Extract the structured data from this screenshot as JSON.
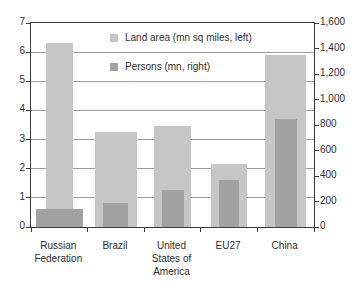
{
  "figure": {
    "background": "#ffffff"
  },
  "chart_data": {
    "type": "bar",
    "title": "",
    "xlabel": "",
    "ylabel_left": "Land area (mn sq miles)",
    "ylabel_right": "Persons (mn)",
    "categories": [
      "Russian Federation",
      "Brazil",
      "United States of America",
      "EU27",
      "China"
    ],
    "category_label_lines": [
      "Russian\nFederation",
      "Brazil",
      "United\nStates of\nAmerica",
      "EU27",
      "China"
    ],
    "series": [
      {
        "name": "Land area (mn sq miles, left)",
        "axis": "left",
        "color": "#c6c6c6",
        "values": [
          6.3,
          3.25,
          3.45,
          2.15,
          5.9
        ]
      },
      {
        "name": "Persons (mn, right)",
        "axis": "right",
        "color": "#a2a2a2",
        "values": [
          140,
          185,
          290,
          365,
          850
        ]
      }
    ],
    "left_axis": {
      "min": 0,
      "max": 7,
      "ticks": [
        0,
        1,
        2,
        3,
        4,
        5,
        6,
        7
      ],
      "tick_labels": [
        "0",
        "1",
        "2",
        "3",
        "4",
        "5",
        "6",
        "7"
      ]
    },
    "right_axis": {
      "min": 0,
      "max": 1600,
      "ticks": [
        0,
        200,
        400,
        600,
        800,
        1000,
        1200,
        1400,
        1600
      ],
      "tick_labels": [
        "0",
        "200",
        "400",
        "600",
        "800",
        "1,000",
        "1,200",
        "1,400",
        "1,600"
      ]
    },
    "grid": {
      "horizontal": true,
      "at_left_axis_ticks": true,
      "color": "#9e9e9e"
    },
    "legend": {
      "position": "top-center-inside"
    },
    "layout_hints": {
      "bar_widths_land": [
        27,
        42,
        37,
        36,
        41
      ],
      "bar_widths_persons": [
        47,
        25,
        22,
        20,
        22
      ]
    }
  }
}
